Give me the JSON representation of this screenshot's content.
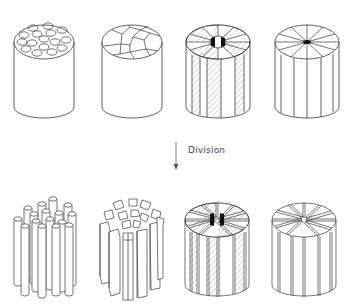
{
  "diagram": {
    "type": "process",
    "colors": {
      "stroke": "#3a3a3a",
      "fill": "#ffffff",
      "hatch": "#7a7a7a",
      "core": "#111111"
    },
    "arrow": {
      "label": "Division",
      "direction": "down"
    },
    "top_row": [
      {
        "id": "bundle-of-rods",
        "top_pattern": "circles",
        "count": 16
      },
      {
        "id": "polygonal-cells",
        "top_pattern": "polygons"
      },
      {
        "id": "hatched-sectors",
        "top_pattern": "radial-sectors-hatched",
        "sectors": 12,
        "core": "black"
      },
      {
        "id": "plain-sectors",
        "top_pattern": "radial-sectors",
        "sectors": 12,
        "core": "black-dot"
      }
    ],
    "bottom_row": [
      {
        "id": "separated-rods",
        "pieces": 16
      },
      {
        "id": "separated-polygonal-columns"
      },
      {
        "id": "split-hatched-sectors",
        "sectors": 12
      },
      {
        "id": "split-plain-sectors",
        "sectors": 12
      }
    ]
  }
}
